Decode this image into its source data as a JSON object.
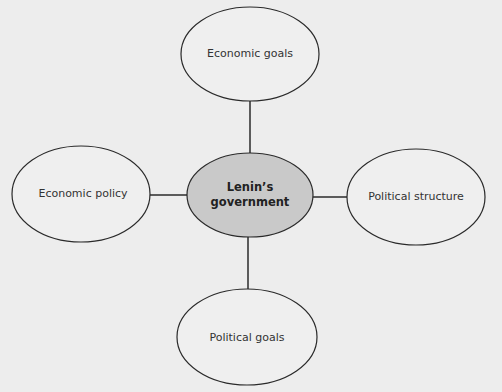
{
  "diagram": {
    "type": "spider-diagram",
    "center": {
      "label": "Lenin's government",
      "line1": "Lenin’s",
      "line2": "government",
      "fill": "#c9c9c9"
    },
    "nodes": [
      {
        "id": "top",
        "label": "Economic goals"
      },
      {
        "id": "left",
        "label": "Economic policy"
      },
      {
        "id": "right",
        "label": "Political structure"
      },
      {
        "id": "bottom",
        "label": "Political goals"
      }
    ],
    "colors": {
      "background": "#ededed",
      "node_fill": "#efefef",
      "stroke": "#2a2a2a"
    }
  }
}
